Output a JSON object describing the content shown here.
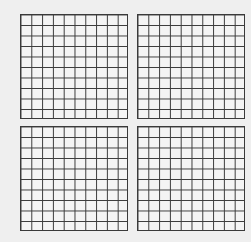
{
  "diagram": {
    "type": "hundreds-grids",
    "grid_count": 4,
    "layout": {
      "rows": 2,
      "cols": 2
    },
    "grids": [
      {
        "position": "top-left",
        "rows": 10,
        "cols": 10,
        "shaded_cells": 0
      },
      {
        "position": "top-right",
        "rows": 10,
        "cols": 10,
        "shaded_cells": 0
      },
      {
        "position": "bottom-left",
        "rows": 10,
        "cols": 10,
        "shaded_cells": 0
      },
      {
        "position": "bottom-right",
        "rows": 10,
        "cols": 10,
        "shaded_cells": 0
      }
    ],
    "colors": {
      "line": "#3a3a3a",
      "background": "#efefef",
      "cell_fill": "#f4f4f4"
    }
  }
}
